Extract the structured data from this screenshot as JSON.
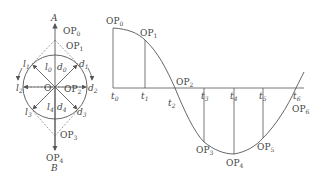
{
  "circle_diagram": {
    "center_label": "O",
    "top_axis_label": "A",
    "bottom_axis_label": "B",
    "left_labels": [
      "l",
      "l",
      "l",
      "l",
      "l"
    ],
    "left_label_subs": [
      "0",
      "1",
      "2",
      "3",
      "4"
    ],
    "right_labels": [
      "d",
      "d",
      "d",
      "d",
      "d"
    ],
    "right_label_subs": [
      "0",
      "1",
      "2",
      "3",
      "4"
    ],
    "op_labels": [
      {
        "base": "OP",
        "sub": "0"
      },
      {
        "base": "OP",
        "sub": "1"
      },
      {
        "base": "OP",
        "sub": "2"
      },
      {
        "base": "OP",
        "sub": "3"
      },
      {
        "base": "OP",
        "sub": "4"
      }
    ]
  },
  "curve_diagram": {
    "t_labels": [
      {
        "base": "t",
        "sub": "0"
      },
      {
        "base": "t",
        "sub": "1"
      },
      {
        "base": "t",
        "sub": "2"
      },
      {
        "base": "t",
        "sub": "3"
      },
      {
        "base": "t",
        "sub": "4"
      },
      {
        "base": "t",
        "sub": "5"
      },
      {
        "base": "t",
        "sub": "6"
      }
    ],
    "op_labels": [
      {
        "base": "OP",
        "sub": "0"
      },
      {
        "base": "OP",
        "sub": "1"
      },
      {
        "base": "OP",
        "sub": "2"
      },
      {
        "base": "OP",
        "sub": "3"
      },
      {
        "base": "OP",
        "sub": "4"
      },
      {
        "base": "OP",
        "sub": "5"
      },
      {
        "base": "OP",
        "sub": "6"
      }
    ]
  },
  "colors": {
    "line": "#555555",
    "text": "#444444"
  }
}
